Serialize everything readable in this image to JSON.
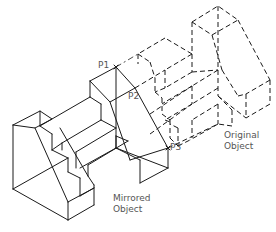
{
  "diagram": {
    "type": "isometric-mirror-illustration",
    "labels": {
      "p1": "P1",
      "p2": "P2",
      "p3": "P3",
      "original_line1": "Original",
      "original_line2": "Object",
      "mirrored_line1": "Mirrored",
      "mirrored_line2": "Object"
    },
    "colors": {
      "line": "#1a1a1a",
      "label": "#555555",
      "background": "#ffffff"
    },
    "objects": [
      {
        "name": "Mirrored Object",
        "style": "solid lines"
      },
      {
        "name": "Original Object",
        "style": "dashed lines"
      }
    ],
    "mirror_points": [
      "P1",
      "P2",
      "P3"
    ]
  }
}
